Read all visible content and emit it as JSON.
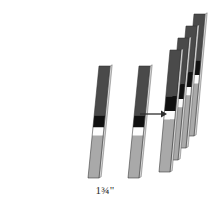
{
  "figure": {
    "background_color": "#ffffff",
    "dimension_label": "1¾\"",
    "arrow": {
      "name": "transform-arrow",
      "direction": "right",
      "x1": 140,
      "y1": 114,
      "x2": 167,
      "y2": 114,
      "color": "#2e2e2e"
    },
    "palette": {
      "dark_gray": "#4a4a4a",
      "mid_gray": "#5e5e5e",
      "black_band": "#111111",
      "white_band": "#fdfdfd",
      "light_gray": "#a9a9a9",
      "pale_gray": "#bdbdbd",
      "edge": "#303030",
      "side_face": "#d2d2d2"
    },
    "geometry": {
      "strip_width": 11,
      "slant_dx": 9,
      "strip_height": 108,
      "note": "Each strip is a thin parallelogram; the top edge is offset to the right of the bottom edge."
    },
    "strips": [
      {
        "name": "strip-left-single",
        "group": "left",
        "bottom_x": 88,
        "bottom_y": 178,
        "top_x": 99,
        "top_y": 66,
        "width": 11,
        "bands": [
          {
            "name": "band-dark-top",
            "start": 0.0,
            "end": 0.44,
            "color": "#4a4a4a"
          },
          {
            "name": "band-black",
            "start": 0.44,
            "end": 0.55,
            "color": "#111111"
          },
          {
            "name": "band-white",
            "start": 0.55,
            "end": 0.62,
            "color": "#fdfdfd"
          },
          {
            "name": "band-light-gray",
            "start": 0.62,
            "end": 1.0,
            "color": "#a9a9a9"
          }
        ]
      },
      {
        "name": "strip-middle-single",
        "group": "middle",
        "bottom_x": 128,
        "bottom_y": 178,
        "top_x": 139,
        "top_y": 66,
        "width": 11,
        "bands": [
          {
            "name": "band-dark-top",
            "start": 0.0,
            "end": 0.44,
            "color": "#4a4a4a"
          },
          {
            "name": "band-black",
            "start": 0.44,
            "end": 0.55,
            "color": "#111111"
          },
          {
            "name": "band-white",
            "start": 0.55,
            "end": 0.62,
            "color": "#fdfdfd"
          },
          {
            "name": "band-light-gray",
            "start": 0.62,
            "end": 1.0,
            "color": "#a9a9a9"
          }
        ]
      },
      {
        "name": "strip-stack-1-back",
        "group": "stack",
        "bottom_x": 183,
        "bottom_y": 136,
        "top_x": 194,
        "top_y": 14,
        "width": 11,
        "bands": [
          {
            "name": "band-dark-top",
            "start": 0.0,
            "end": 0.38,
            "color": "#4a4a4a"
          },
          {
            "name": "band-black",
            "start": 0.38,
            "end": 0.5,
            "color": "#111111"
          },
          {
            "name": "band-white",
            "start": 0.5,
            "end": 0.57,
            "color": "#fdfdfd"
          },
          {
            "name": "band-light-gray",
            "start": 0.57,
            "end": 1.0,
            "color": "#a9a9a9"
          }
        ]
      },
      {
        "name": "strip-stack-2",
        "group": "stack",
        "bottom_x": 175,
        "bottom_y": 148,
        "top_x": 186,
        "top_y": 26,
        "width": 11,
        "bands": [
          {
            "name": "band-dark-top",
            "start": 0.0,
            "end": 0.38,
            "color": "#4a4a4a"
          },
          {
            "name": "band-black",
            "start": 0.38,
            "end": 0.5,
            "color": "#111111"
          },
          {
            "name": "band-white",
            "start": 0.5,
            "end": 0.57,
            "color": "#fdfdfd"
          },
          {
            "name": "band-light-gray",
            "start": 0.57,
            "end": 1.0,
            "color": "#a9a9a9"
          }
        ]
      },
      {
        "name": "strip-stack-3",
        "group": "stack",
        "bottom_x": 167,
        "bottom_y": 160,
        "top_x": 178,
        "top_y": 38,
        "width": 11,
        "bands": [
          {
            "name": "band-dark-top",
            "start": 0.0,
            "end": 0.38,
            "color": "#4a4a4a"
          },
          {
            "name": "band-black",
            "start": 0.38,
            "end": 0.5,
            "color": "#111111"
          },
          {
            "name": "band-white",
            "start": 0.5,
            "end": 0.57,
            "color": "#fdfdfd"
          },
          {
            "name": "band-light-gray",
            "start": 0.57,
            "end": 1.0,
            "color": "#a9a9a9"
          }
        ]
      },
      {
        "name": "strip-stack-4-front",
        "group": "stack",
        "bottom_x": 159,
        "bottom_y": 172,
        "top_x": 170,
        "top_y": 50,
        "width": 11,
        "bands": [
          {
            "name": "band-dark-top",
            "start": 0.0,
            "end": 0.38,
            "color": "#4a4a4a"
          },
          {
            "name": "band-black",
            "start": 0.38,
            "end": 0.5,
            "color": "#111111"
          },
          {
            "name": "band-white",
            "start": 0.5,
            "end": 0.57,
            "color": "#fdfdfd"
          },
          {
            "name": "band-light-gray",
            "start": 0.57,
            "end": 1.0,
            "color": "#a9a9a9"
          }
        ]
      }
    ]
  }
}
